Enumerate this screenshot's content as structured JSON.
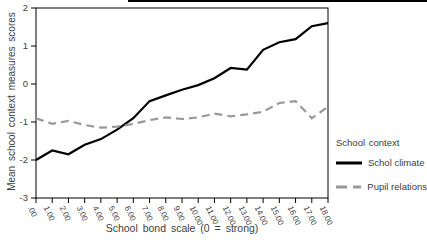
{
  "chart_data": {
    "type": "line",
    "title": "",
    "xlabel": "School bond scale (0 = strong)",
    "ylabel": "Mean school context measures scores",
    "x_tick_labels": [
      ".00",
      "1.00",
      "2.00",
      "3.00",
      "4.00",
      "5.00",
      "6.00",
      "7.00",
      "8.00",
      "9.00",
      "10.00",
      "11.00",
      "12.00",
      "13.00",
      "14.00",
      "15.00",
      "16.00",
      "17.00",
      "18.00"
    ],
    "x_values": [
      0,
      1,
      2,
      3,
      4,
      5,
      6,
      7,
      8,
      9,
      10,
      11,
      12,
      13,
      14,
      15,
      16,
      17,
      18
    ],
    "y_tick_labels": [
      "2",
      "1",
      "0",
      "-1",
      "-2",
      "-3"
    ],
    "y_tick_values": [
      2,
      1,
      0,
      -1,
      -2,
      -3
    ],
    "xlim": [
      0,
      18
    ],
    "ylim": [
      -3,
      2
    ],
    "grid": false,
    "legend": {
      "title": "School context",
      "position": "right"
    },
    "series": [
      {
        "name": "Schol climate",
        "line_style": "solid",
        "color": "#000000",
        "values": [
          -2.0,
          -1.75,
          -1.85,
          -1.6,
          -1.45,
          -1.2,
          -0.9,
          -0.45,
          -0.3,
          -0.15,
          -0.03,
          0.15,
          0.42,
          0.38,
          0.9,
          1.1,
          1.18,
          1.52,
          1.6
        ]
      },
      {
        "name": "Pupil relations",
        "line_style": "dashed",
        "color": "#999999",
        "values": [
          -0.9,
          -1.05,
          -0.97,
          -1.08,
          -1.15,
          -1.12,
          -1.05,
          -0.95,
          -0.88,
          -0.92,
          -0.88,
          -0.78,
          -0.85,
          -0.8,
          -0.73,
          -0.5,
          -0.45,
          -0.9,
          -0.6
        ]
      }
    ]
  },
  "colors": {
    "background": "#ffffff",
    "frame": "#000000",
    "tick": "#000000",
    "text": "#3d3d3d",
    "series_solid": "#000000",
    "series_dashed": "#999999"
  }
}
